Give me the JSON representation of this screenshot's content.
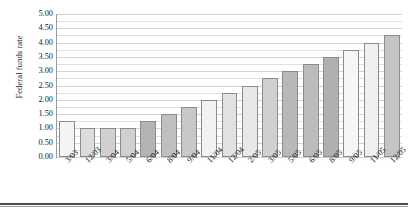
{
  "chart_data": {
    "type": "bar",
    "title": "",
    "xlabel": "",
    "ylabel": "Federal funds rate",
    "ylim": [
      0.0,
      5.0
    ],
    "ytick_step": 0.5,
    "gridline_step": 0.25,
    "grid": true,
    "legend": false,
    "categories": [
      "3/03",
      "12/03",
      "3/04",
      "5/04",
      "6/04",
      "8/04",
      "9/04",
      "11/04",
      "12/04",
      "2/05",
      "3/05",
      "5/05",
      "6/05",
      "8/05",
      "9/05",
      "11/05",
      "12/05"
    ],
    "values": [
      1.25,
      1.0,
      1.0,
      1.0,
      1.25,
      1.5,
      1.75,
      2.0,
      2.25,
      2.5,
      2.75,
      3.0,
      3.25,
      3.5,
      3.75,
      4.0,
      4.25
    ],
    "ytick_labels": [
      "0.00",
      "0.50",
      "1.00",
      "1.50",
      "2.00",
      "2.50",
      "3.00",
      "3.50",
      "4.00",
      "4.50",
      "5.00"
    ],
    "ytick_values": [
      0.0,
      0.5,
      1.0,
      1.5,
      2.0,
      2.5,
      3.0,
      3.5,
      4.0,
      4.5,
      5.0
    ],
    "bar_colors": [
      "#f4f4f4",
      "#dcdcdc",
      "#d0d0d0",
      "#d0d0d0",
      "#b4b4b4",
      "#c0c0c0",
      "#c8c8c8",
      "#f2f2f2",
      "#e2e2e2",
      "#e8e8e8",
      "#d0d0d0",
      "#b8b8b8",
      "#bcbcbc",
      "#b0b0b0",
      "#f6f6f6",
      "#f0f0f0",
      "#c4c4c4"
    ],
    "bar_edge_color": "#8c8c8c",
    "grid_color": "#d2d2d2",
    "axis_color": "#9a9a9a",
    "text_color": "#1a1a1a"
  }
}
